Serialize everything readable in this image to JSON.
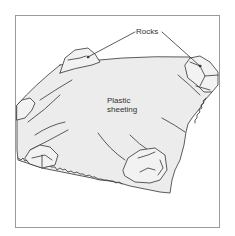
{
  "figure": {
    "labels": {
      "rocks": "Rocks",
      "sheet_line1": "Plastic",
      "sheet_line2": "sheeting"
    },
    "colors": {
      "frame": "#9a9a9a",
      "line": "#333333",
      "sheet_fill": "#ececec",
      "rock_fill": "#f2f2f2",
      "background": "#ffffff"
    },
    "elements": [
      "plastic sheet",
      "rock top-left",
      "rock top-right",
      "rock left",
      "rock bottom-left",
      "rock bottom-center"
    ]
  }
}
